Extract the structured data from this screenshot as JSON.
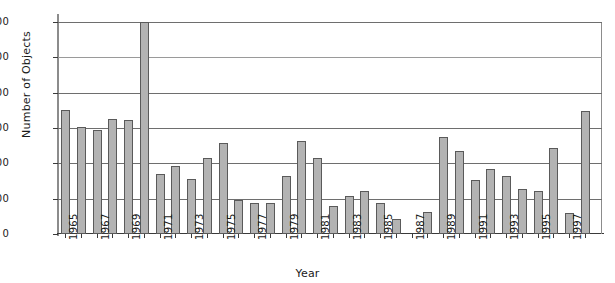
{
  "chart_data": {
    "type": "bar",
    "title": "",
    "xlabel": "Year",
    "ylabel": "Number of Objects",
    "grid": true,
    "legend": null,
    "ylim": [
      0,
      1400
    ],
    "ytick_labels": [
      "1400",
      "1200",
      "800",
      "600",
      "400",
      "200",
      "0"
    ],
    "xtick_labels": [
      "1965",
      "1967",
      "1969",
      "1971",
      "1973",
      "1975",
      "1977",
      "1979",
      "1981",
      "1983",
      "1985",
      "1987",
      "1989",
      "1991",
      "1993",
      "1995",
      "1997"
    ],
    "categories": [
      "1965",
      "1966",
      "1967",
      "1968",
      "1969",
      "1970",
      "1971",
      "1972",
      "1973",
      "1974",
      "1975",
      "1976",
      "1977",
      "1978",
      "1979",
      "1980",
      "1981",
      "1982",
      "1983",
      "1984",
      "1985",
      "1986",
      "1987",
      "1988",
      "1989",
      "1990",
      "1991",
      "1992",
      "1993",
      "1994",
      "1995",
      "1996",
      "1997",
      "1998"
    ],
    "values": [
      820,
      705,
      685,
      760,
      750,
      1400,
      395,
      450,
      360,
      505,
      600,
      225,
      205,
      205,
      380,
      615,
      505,
      185,
      250,
      285,
      205,
      100,
      0,
      145,
      640,
      545,
      355,
      430,
      385,
      300,
      285,
      570,
      140,
      810
    ],
    "bar_color": "#b3b3b3",
    "bar_edge_color": "#5a5a5a",
    "grid_color": "#6e6e6e",
    "axis_color": "#3a3a3a",
    "background": "#ffffff"
  }
}
